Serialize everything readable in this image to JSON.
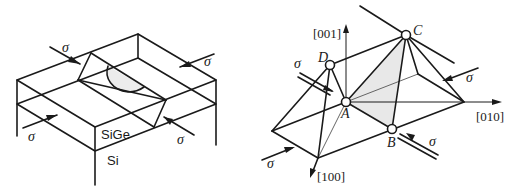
{
  "figure": {
    "left_panel": {
      "description": "SiGe layer on Si substrate under biaxial stress with a dislocation half-loop",
      "layer_labels": {
        "top_layer": "SiGe",
        "substrate": "Si"
      },
      "stress_labels": [
        "σ",
        "σ",
        "σ",
        "σ"
      ]
    },
    "right_panel": {
      "description": "Octahedral crystal geometry with slip plane shaded, under stress",
      "axes": {
        "z": "[001]",
        "y": "[010]",
        "x": "[100]"
      },
      "vertices": {
        "a": "A",
        "b": "B",
        "c": "C",
        "d": "D"
      },
      "stress_labels": [
        "σ",
        "σ",
        "σ",
        "σ"
      ],
      "shaded_plane": "ABC",
      "colors": {
        "line": "#1a1a1a",
        "shade": "#e6e6e6"
      }
    }
  }
}
